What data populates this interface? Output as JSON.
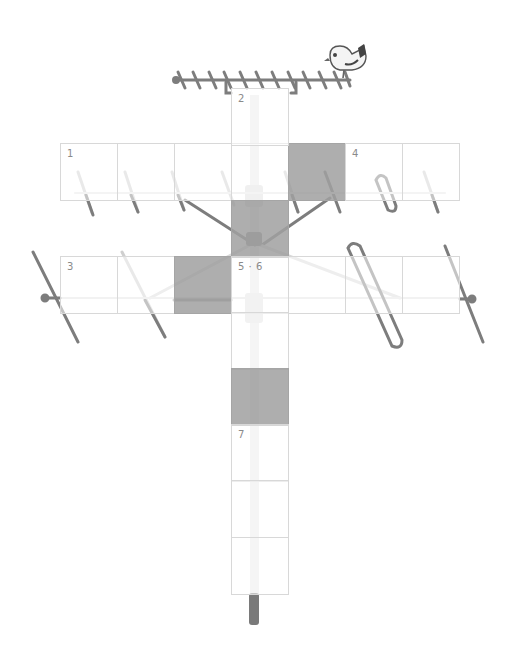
{
  "puzzle": {
    "type": "crossword",
    "theme_illustration": "tv-antenna-with-bird",
    "cell_size": 57,
    "colors": {
      "grid_line": "#d8d8d8",
      "block_fill": "#a9a9a9",
      "clue_number": "#8a8a8a",
      "antenna": "#7d7d7d",
      "mast_light": "#e6e6e6"
    },
    "cells": [
      {
        "id": "r1c1",
        "row": 1,
        "col": 1,
        "x": 60,
        "y": 143,
        "block": false,
        "number": "1"
      },
      {
        "id": "r1c2",
        "row": 1,
        "col": 2,
        "x": 117,
        "y": 143,
        "block": false,
        "number": ""
      },
      {
        "id": "r1c3",
        "row": 1,
        "col": 3,
        "x": 174,
        "y": 143,
        "block": false,
        "number": ""
      },
      {
        "id": "r1c4",
        "row": 1,
        "col": 4,
        "x": 231,
        "y": 143,
        "block": false,
        "number": ""
      },
      {
        "id": "r1c5",
        "row": 1,
        "col": 5,
        "x": 288,
        "y": 143,
        "block": true,
        "number": ""
      },
      {
        "id": "r1c6",
        "row": 1,
        "col": 6,
        "x": 345,
        "y": 143,
        "block": false,
        "number": "4"
      },
      {
        "id": "r1c7",
        "row": 1,
        "col": 7,
        "x": 402,
        "y": 143,
        "block": false,
        "number": ""
      },
      {
        "id": "r0c4",
        "row": 0,
        "col": 4,
        "x": 231,
        "y": 88,
        "block": false,
        "number": "2"
      },
      {
        "id": "r2c4",
        "row": 2,
        "col": 4,
        "x": 231,
        "y": 200,
        "block": true,
        "number": ""
      },
      {
        "id": "r3c1",
        "row": 3,
        "col": 1,
        "x": 60,
        "y": 256,
        "block": false,
        "number": "3"
      },
      {
        "id": "r3c2",
        "row": 3,
        "col": 2,
        "x": 117,
        "y": 256,
        "block": false,
        "number": ""
      },
      {
        "id": "r3c3",
        "row": 3,
        "col": 3,
        "x": 174,
        "y": 256,
        "block": true,
        "number": ""
      },
      {
        "id": "r3c4",
        "row": 3,
        "col": 4,
        "x": 231,
        "y": 256,
        "block": false,
        "number": "5 · 6"
      },
      {
        "id": "r3c5",
        "row": 3,
        "col": 5,
        "x": 288,
        "y": 256,
        "block": false,
        "number": ""
      },
      {
        "id": "r3c6",
        "row": 3,
        "col": 6,
        "x": 345,
        "y": 256,
        "block": false,
        "number": ""
      },
      {
        "id": "r3c7",
        "row": 3,
        "col": 7,
        "x": 402,
        "y": 256,
        "block": false,
        "number": ""
      },
      {
        "id": "r4c4",
        "row": 4,
        "col": 4,
        "x": 231,
        "y": 312,
        "block": false,
        "number": ""
      },
      {
        "id": "r5c4",
        "row": 5,
        "col": 4,
        "x": 231,
        "y": 368,
        "block": true,
        "number": ""
      },
      {
        "id": "r6c4",
        "row": 6,
        "col": 4,
        "x": 231,
        "y": 424,
        "block": false,
        "number": "7"
      },
      {
        "id": "r7c4",
        "row": 7,
        "col": 4,
        "x": 231,
        "y": 480,
        "block": false,
        "number": ""
      },
      {
        "id": "r8c4",
        "row": 8,
        "col": 4,
        "x": 231,
        "y": 537,
        "block": false,
        "number": ""
      }
    ],
    "clue_numbers": [
      "1",
      "2",
      "3",
      "4",
      "5 · 6",
      "7"
    ]
  }
}
